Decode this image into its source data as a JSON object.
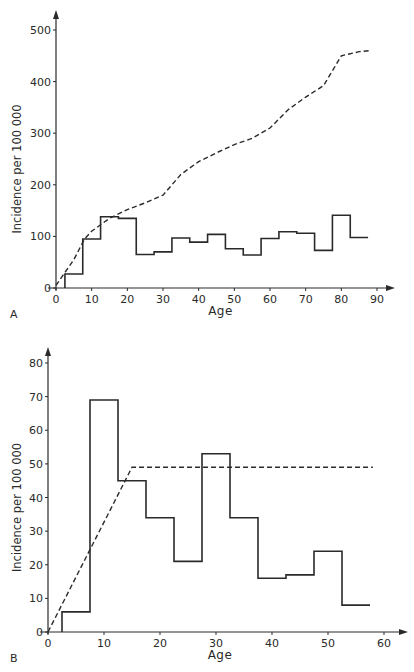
{
  "chart_data": [
    {
      "panel": "A",
      "type": "line",
      "title": "",
      "xlabel": "Age",
      "ylabel": "Incidence per 100 000",
      "xlim": [
        0,
        95
      ],
      "ylim": [
        0,
        530
      ],
      "xticks": [
        0,
        10,
        20,
        30,
        40,
        50,
        60,
        70,
        80,
        90
      ],
      "yticks": [
        0,
        100,
        200,
        300,
        400,
        500
      ],
      "grid": false,
      "histogram": {
        "name": "Age-specific incidence",
        "style": "solid-step",
        "bin_edges": [
          2.5,
          7.5,
          12.5,
          17.5,
          22.5,
          27.5,
          32.5,
          37.5,
          42.5,
          47.5,
          52.5,
          57.5,
          62.5,
          67.5,
          72.5,
          77.5,
          82.5,
          87.5
        ],
        "values": [
          27,
          95,
          138,
          135,
          65,
          70,
          97,
          89,
          104,
          76,
          64,
          96,
          109,
          106,
          73,
          141,
          98
        ]
      },
      "curve": {
        "name": "Cumulative incidence",
        "style": "dashed",
        "x": [
          0,
          5,
          8,
          10,
          15,
          20,
          25,
          30,
          35,
          40,
          45,
          50,
          55,
          60,
          65,
          70,
          75,
          80,
          85,
          88
        ],
        "y": [
          5,
          55,
          95,
          110,
          135,
          152,
          165,
          180,
          220,
          245,
          262,
          278,
          290,
          310,
          345,
          370,
          392,
          450,
          458,
          460
        ]
      }
    },
    {
      "panel": "B",
      "type": "line",
      "title": "",
      "xlabel": "Age",
      "ylabel": "Incidence per 100 000",
      "xlim": [
        0,
        63
      ],
      "ylim": [
        0,
        84
      ],
      "xticks": [
        0,
        10,
        20,
        30,
        40,
        50,
        60
      ],
      "yticks": [
        0,
        10,
        20,
        30,
        40,
        50,
        60,
        70,
        80
      ],
      "grid": false,
      "histogram": {
        "name": "Age-specific incidence",
        "style": "solid-step",
        "bin_edges": [
          2.5,
          7.5,
          12.5,
          17.5,
          22.5,
          27.5,
          32.5,
          37.5,
          42.5,
          47.5,
          52.5,
          57.5
        ],
        "values": [
          6,
          69,
          45,
          34,
          21,
          53,
          34,
          16,
          17,
          24,
          8
        ]
      },
      "curve": {
        "name": "Cumulative incidence",
        "style": "dashed",
        "x": [
          0,
          15,
          58
        ],
        "y": [
          0,
          49,
          49
        ]
      }
    }
  ],
  "panels": [
    {
      "label": "A",
      "xlabel": "Age",
      "ylabel": "Incidence per 100 000"
    },
    {
      "label": "B",
      "xlabel": "Age",
      "ylabel": "Incidence per 100 000"
    }
  ],
  "layout": [
    {
      "x0": 56,
      "x1": 377,
      "y0": 288,
      "yTop": 30,
      "xmax_tick": 90,
      "ymax_tick": 500,
      "axisEndX": 395,
      "axisTopY": 10
    },
    {
      "x0": 48,
      "x1": 384,
      "y0": 632,
      "yTop": 363,
      "xmax_tick": 60,
      "ymax_tick": 80,
      "axisEndX": 408,
      "axisTopY": 347
    }
  ],
  "colors": {
    "ink": "#2a2a2a",
    "background": "#ffffff"
  }
}
